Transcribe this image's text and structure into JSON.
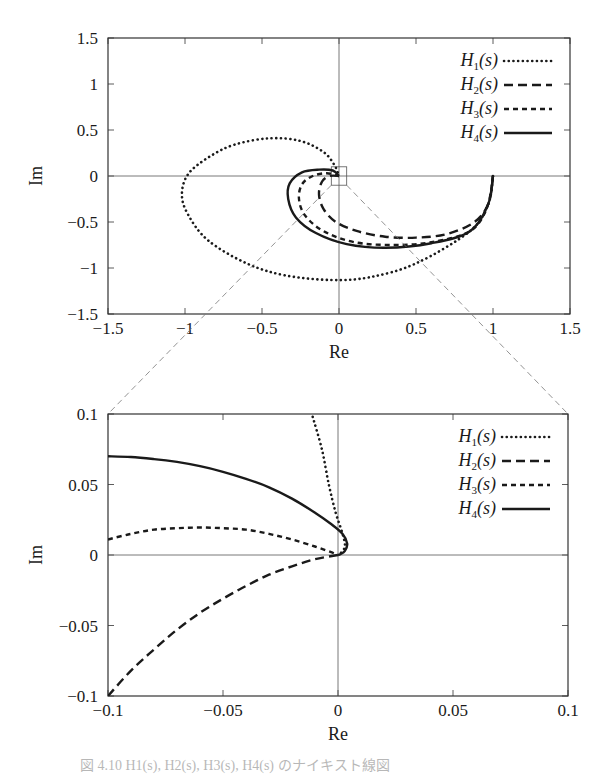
{
  "chart_data": [
    {
      "type": "line",
      "title": "",
      "xlabel": "Re",
      "ylabel": "Im",
      "xlim": [
        -1.5,
        1.5
      ],
      "ylim": [
        -1.5,
        1.5
      ],
      "xticks": [
        "−1.5",
        "−1",
        "−0.5",
        "0",
        "0.5",
        "1",
        "1.5"
      ],
      "yticks": [
        "1.5",
        "1",
        "0.5",
        "0",
        "−0.5",
        "−1",
        "−1.5"
      ],
      "grid": false,
      "zero_lines": true,
      "legend_position": "upper right",
      "zoom_box": {
        "x": [
          -0.1,
          0.1
        ],
        "y": [
          -0.1,
          0.1
        ]
      },
      "series": [
        {
          "name": "H1(s)",
          "style": "dotted",
          "points": [
            [
              1,
              0
            ],
            [
              0.97,
              -0.3
            ],
            [
              0.85,
              -0.6
            ],
            [
              0.5,
              -0.95
            ],
            [
              0.2,
              -1.1
            ],
            [
              -0.05,
              -1.13
            ],
            [
              -0.35,
              -1.08
            ],
            [
              -0.6,
              -0.95
            ],
            [
              -0.85,
              -0.7
            ],
            [
              -0.98,
              -0.42
            ],
            [
              -1.02,
              -0.2
            ],
            [
              -0.98,
              0.02
            ],
            [
              -0.85,
              0.2
            ],
            [
              -0.68,
              0.34
            ],
            [
              -0.45,
              0.41
            ],
            [
              -0.25,
              0.38
            ],
            [
              -0.1,
              0.26
            ],
            [
              -0.03,
              0.12
            ],
            [
              0,
              0
            ]
          ]
        },
        {
          "name": "H2(s)",
          "style": "long-dash",
          "points": [
            [
              1,
              0
            ],
            [
              0.97,
              -0.3
            ],
            [
              0.88,
              -0.5
            ],
            [
              0.7,
              -0.63
            ],
            [
              0.5,
              -0.67
            ],
            [
              0.3,
              -0.66
            ],
            [
              0.12,
              -0.6
            ],
            [
              -0.02,
              -0.5
            ],
            [
              -0.1,
              -0.36
            ],
            [
              -0.13,
              -0.2
            ],
            [
              -0.11,
              -0.06
            ],
            [
              -0.06,
              0.0
            ],
            [
              0,
              0
            ]
          ]
        },
        {
          "name": "H3(s)",
          "style": "short-dash",
          "points": [
            [
              1,
              0
            ],
            [
              0.96,
              -0.35
            ],
            [
              0.85,
              -0.6
            ],
            [
              0.6,
              -0.72
            ],
            [
              0.35,
              -0.75
            ],
            [
              0.1,
              -0.72
            ],
            [
              -0.1,
              -0.6
            ],
            [
              -0.22,
              -0.43
            ],
            [
              -0.26,
              -0.25
            ],
            [
              -0.24,
              -0.09
            ],
            [
              -0.17,
              0.0
            ],
            [
              -0.08,
              0.03
            ],
            [
              0,
              0
            ]
          ]
        },
        {
          "name": "H4(s)",
          "style": "solid",
          "points": [
            [
              1,
              0
            ],
            [
              0.97,
              -0.3
            ],
            [
              0.85,
              -0.6
            ],
            [
              0.6,
              -0.73
            ],
            [
              0.3,
              -0.78
            ],
            [
              0.05,
              -0.74
            ],
            [
              -0.15,
              -0.62
            ],
            [
              -0.28,
              -0.45
            ],
            [
              -0.33,
              -0.25
            ],
            [
              -0.32,
              -0.08
            ],
            [
              -0.24,
              0.04
            ],
            [
              -0.13,
              0.07
            ],
            [
              -0.04,
              0.06
            ],
            [
              0,
              0
            ]
          ]
        }
      ]
    },
    {
      "type": "line",
      "title": "",
      "xlabel": "Re",
      "ylabel": "Im",
      "xlim": [
        -0.1,
        0.1
      ],
      "ylim": [
        -0.1,
        0.1
      ],
      "xticks": [
        "−0.1",
        "−0.05",
        "0",
        "0.05",
        "0.1"
      ],
      "yticks": [
        "0.1",
        "0.05",
        "0",
        "−0.05",
        "−0.1"
      ],
      "grid": false,
      "zero_lines": true,
      "legend_position": "upper right",
      "series": [
        {
          "name": "H1(s)",
          "style": "dotted",
          "points": [
            [
              -0.011,
              0.098
            ],
            [
              -0.007,
              0.075
            ],
            [
              -0.004,
              0.05
            ],
            [
              -0.001,
              0.03
            ],
            [
              0.002,
              0.015
            ],
            [
              0.003,
              0.006
            ],
            [
              0.001,
              0.001
            ],
            [
              0,
              0
            ]
          ]
        },
        {
          "name": "H2(s)",
          "style": "long-dash",
          "points": [
            [
              -0.1,
              -0.1
            ],
            [
              -0.09,
              -0.082
            ],
            [
              -0.08,
              -0.067
            ],
            [
              -0.07,
              -0.053
            ],
            [
              -0.06,
              -0.041
            ],
            [
              -0.05,
              -0.031
            ],
            [
              -0.04,
              -0.022
            ],
            [
              -0.03,
              -0.014
            ],
            [
              -0.02,
              -0.008
            ],
            [
              -0.01,
              -0.003
            ],
            [
              0,
              0
            ]
          ]
        },
        {
          "name": "H3(s)",
          "style": "short-dash",
          "points": [
            [
              -0.1,
              0.011
            ],
            [
              -0.09,
              0.015
            ],
            [
              -0.08,
              0.018
            ],
            [
              -0.07,
              0.019
            ],
            [
              -0.06,
              0.0195
            ],
            [
              -0.05,
              0.019
            ],
            [
              -0.04,
              0.018
            ],
            [
              -0.03,
              0.015
            ],
            [
              -0.02,
              0.011
            ],
            [
              -0.01,
              0.006
            ],
            [
              -0.003,
              0.002
            ],
            [
              0,
              0
            ]
          ]
        },
        {
          "name": "H4(s)",
          "style": "solid",
          "points": [
            [
              -0.1,
              0.07
            ],
            [
              -0.09,
              0.0695
            ],
            [
              -0.08,
              0.068
            ],
            [
              -0.07,
              0.066
            ],
            [
              -0.06,
              0.063
            ],
            [
              -0.05,
              0.059
            ],
            [
              -0.04,
              0.054
            ],
            [
              -0.03,
              0.048
            ],
            [
              -0.02,
              0.04
            ],
            [
              -0.01,
              0.03
            ],
            [
              -0.003,
              0.022
            ],
            [
              0.002,
              0.015
            ],
            [
              0.004,
              0.008
            ],
            [
              0.003,
              0.003
            ],
            [
              0.001,
              0.0005
            ],
            [
              0,
              0
            ]
          ]
        }
      ]
    }
  ],
  "figure": {
    "top_plot": {
      "xlabel": "Re",
      "ylabel": "Im",
      "legend": [
        "H1(s)",
        "H2(s)",
        "H3(s)",
        "H4(s)"
      ]
    },
    "bottom_plot": {
      "xlabel": "Re",
      "ylabel": "Im",
      "legend": [
        "H1(s)",
        "H2(s)",
        "H3(s)",
        "H4(s)"
      ]
    },
    "caption": "図 4.10  H1(s), H2(s), H3(s), H4(s) のナイキスト線図"
  },
  "colors": {
    "line": "#1a1a1a",
    "axis": "#333333",
    "connector": "#666666"
  }
}
